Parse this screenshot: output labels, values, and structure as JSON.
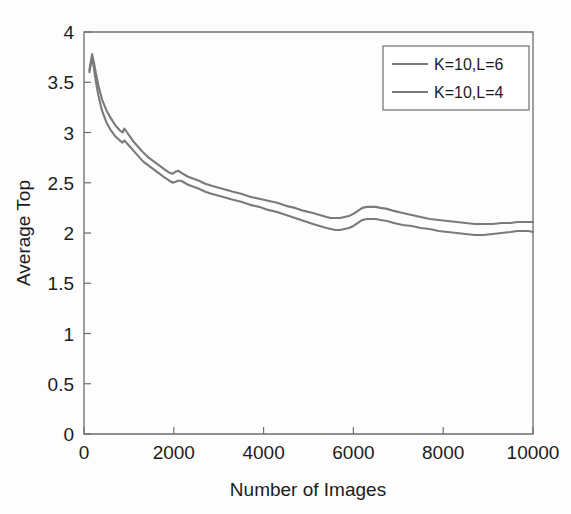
{
  "chart_data": {
    "type": "line",
    "title": "",
    "xlabel": "Number of Images",
    "ylabel": "Average Top",
    "xlim": [
      0,
      10000
    ],
    "ylim": [
      0,
      4
    ],
    "xticks": [
      0,
      2000,
      4000,
      6000,
      8000,
      10000
    ],
    "xtick_labels": [
      "0",
      "2000",
      "4000",
      "6000",
      "8000",
      "10000"
    ],
    "yticks": [
      0,
      0.5,
      1,
      1.5,
      2,
      2.5,
      3,
      3.5,
      4
    ],
    "ytick_labels": [
      "0",
      "0.5",
      "1",
      "1.5",
      "2",
      "2.5",
      "3",
      "3.5",
      "4"
    ],
    "grid": false,
    "legend_position": "top-right",
    "line_color": "#7a7a7a",
    "axis_color": "#6e6e6e",
    "background": "#fdfdfd",
    "series": [
      {
        "name": "K=10,L=6",
        "color": "#7a7a7a",
        "x": [
          120,
          180,
          220,
          260,
          320,
          400,
          500,
          600,
          700,
          800,
          860,
          900,
          960,
          1040,
          1120,
          1200,
          1320,
          1440,
          1560,
          1680,
          1800,
          1900,
          1980,
          2040,
          2100,
          2160,
          2240,
          2320,
          2440,
          2560,
          2700,
          2840,
          3000,
          3160,
          3320,
          3500,
          3700,
          3900,
          4100,
          4300,
          4500,
          4700,
          4900,
          5100,
          5250,
          5400,
          5500,
          5600,
          5700,
          5800,
          5900,
          6000,
          6100,
          6200,
          6300,
          6400,
          6500,
          6600,
          6750,
          6900,
          7100,
          7300,
          7500,
          7700,
          7900,
          8100,
          8300,
          8500,
          8700,
          8900,
          9100,
          9300,
          9500,
          9650,
          9800,
          9900,
          10000
        ],
        "y": [
          3.62,
          3.78,
          3.7,
          3.6,
          3.47,
          3.33,
          3.22,
          3.14,
          3.07,
          3.02,
          3.0,
          3.04,
          3.0,
          2.95,
          2.9,
          2.86,
          2.8,
          2.75,
          2.71,
          2.67,
          2.63,
          2.6,
          2.59,
          2.61,
          2.62,
          2.6,
          2.58,
          2.56,
          2.54,
          2.52,
          2.49,
          2.47,
          2.45,
          2.43,
          2.41,
          2.39,
          2.36,
          2.34,
          2.32,
          2.3,
          2.27,
          2.25,
          2.22,
          2.2,
          2.18,
          2.16,
          2.15,
          2.15,
          2.15,
          2.16,
          2.17,
          2.19,
          2.22,
          2.25,
          2.26,
          2.26,
          2.26,
          2.25,
          2.24,
          2.22,
          2.2,
          2.18,
          2.16,
          2.14,
          2.13,
          2.12,
          2.11,
          2.1,
          2.09,
          2.09,
          2.09,
          2.1,
          2.1,
          2.11,
          2.11,
          2.11,
          2.11
        ]
      },
      {
        "name": "K=10,L=4",
        "color": "#7a7a7a",
        "x": [
          120,
          180,
          220,
          260,
          320,
          400,
          500,
          600,
          700,
          800,
          860,
          900,
          960,
          1040,
          1120,
          1200,
          1320,
          1440,
          1560,
          1680,
          1800,
          1900,
          1980,
          2040,
          2100,
          2160,
          2240,
          2320,
          2440,
          2560,
          2700,
          2840,
          3000,
          3160,
          3320,
          3500,
          3700,
          3900,
          4100,
          4300,
          4500,
          4700,
          4900,
          5100,
          5250,
          5400,
          5500,
          5600,
          5700,
          5800,
          5900,
          6000,
          6100,
          6200,
          6300,
          6400,
          6500,
          6600,
          6750,
          6900,
          7100,
          7300,
          7500,
          7700,
          7900,
          8100,
          8300,
          8500,
          8700,
          8900,
          9100,
          9300,
          9500,
          9650,
          9800,
          9900,
          10000
        ],
        "y": [
          3.6,
          3.75,
          3.64,
          3.52,
          3.37,
          3.22,
          3.1,
          3.02,
          2.96,
          2.92,
          2.9,
          2.92,
          2.89,
          2.85,
          2.81,
          2.77,
          2.71,
          2.67,
          2.63,
          2.59,
          2.55,
          2.52,
          2.5,
          2.51,
          2.52,
          2.52,
          2.5,
          2.48,
          2.46,
          2.44,
          2.41,
          2.39,
          2.37,
          2.35,
          2.33,
          2.31,
          2.28,
          2.26,
          2.23,
          2.21,
          2.18,
          2.15,
          2.12,
          2.09,
          2.07,
          2.05,
          2.04,
          2.03,
          2.03,
          2.04,
          2.05,
          2.07,
          2.1,
          2.13,
          2.14,
          2.14,
          2.14,
          2.13,
          2.12,
          2.1,
          2.08,
          2.07,
          2.05,
          2.04,
          2.02,
          2.01,
          2.0,
          1.99,
          1.98,
          1.98,
          1.99,
          2.0,
          2.01,
          2.02,
          2.02,
          2.02,
          2.01
        ]
      }
    ]
  },
  "legend": {
    "entries": [
      {
        "label": "K=10,L=6"
      },
      {
        "label": "K=10,L=4"
      }
    ]
  },
  "axes": {
    "x_title": "Number of Images",
    "y_title": "Average Top"
  }
}
